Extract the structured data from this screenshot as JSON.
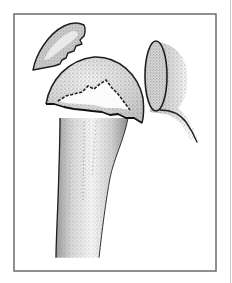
{
  "figure": {
    "alt_text": "Line-and-stipple illustration of a fractured humeral head beside the glenoid of the scapula, with a detached bone fragment above",
    "parts": [
      {
        "id": "bone-fragment",
        "label": "detached fragment"
      },
      {
        "id": "humeral-head",
        "label": "humeral head"
      },
      {
        "id": "fracture-line",
        "label": "fracture line"
      },
      {
        "id": "humeral-shaft",
        "label": "humeral shaft"
      },
      {
        "id": "glenoid",
        "label": "glenoid"
      },
      {
        "id": "scapula-neck",
        "label": "scapula"
      }
    ]
  },
  "colors": {
    "background": "#ffffff",
    "frame": "#6b6b6b",
    "outline": "#1e1e1e",
    "bone_fill": "#efefef",
    "stipple": "#7a7a7a",
    "highlight": "#fafafa"
  }
}
